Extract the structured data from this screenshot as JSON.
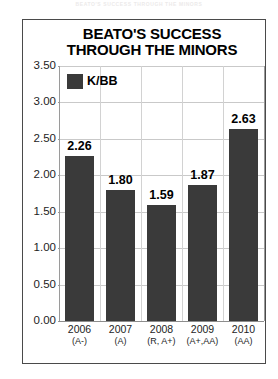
{
  "masthead": {
    "text": "BEATO'S SUCCESS THROUGH THE MINORS"
  },
  "chart_data": {
    "type": "bar",
    "title_line1": "BEATO'S SUCCESS",
    "title_line2": "THROUGH THE MINORS",
    "title": "BEATO'S SUCCESS THROUGH THE MINORS",
    "categories": [
      "2006",
      "2007",
      "2008",
      "2009",
      "2010"
    ],
    "category_sublabels": [
      "(A-)",
      "(A)",
      "(R, A+)",
      "(A+,AA)",
      "(AA)"
    ],
    "values": [
      2.26,
      1.8,
      1.59,
      1.87,
      2.63
    ],
    "value_labels": [
      "2.26",
      "1.80",
      "1.59",
      "1.87",
      "2.63"
    ],
    "series": [
      {
        "name": "K/BB",
        "values": [
          2.26,
          1.8,
          1.59,
          1.87,
          2.63
        ],
        "color": "#3a3a3a"
      }
    ],
    "legend": {
      "position": "inside-top-left",
      "entries": [
        {
          "label": "K/BB",
          "color": "#3a3a3a"
        }
      ]
    },
    "xlabel": "",
    "ylabel": "",
    "ylim": [
      0.0,
      3.5
    ],
    "yticks": [
      3.5,
      3.0,
      2.5,
      2.0,
      1.5,
      1.0,
      0.5,
      0.0
    ],
    "ytick_labels": [
      "3.50",
      "3.00",
      "2.50",
      "2.00",
      "1.50",
      "1.00",
      "0.50",
      "0.00"
    ],
    "grid": {
      "horizontal": true,
      "vertical": true,
      "color": "#c9c9c9"
    },
    "colors": {
      "bar": "#3a3a3a",
      "frame": "#4a4a4a",
      "gridline": "#c9c9c9",
      "axis": "#8d8d8d",
      "text": "#000000",
      "background": "#ffffff"
    }
  }
}
